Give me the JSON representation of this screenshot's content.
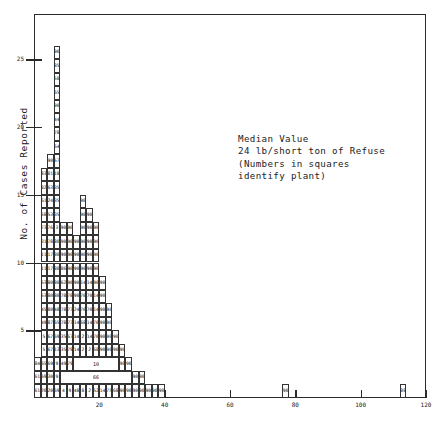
{
  "chart_data": {
    "type": "bar",
    "title": "",
    "xlabel": "",
    "ylabel": "No. of Cases Reported",
    "xlim": [
      0,
      120
    ],
    "ylim": [
      0,
      28
    ],
    "grid": false,
    "legend": null,
    "annotation": "Median Value\n24 lb/short ton of Refuse\n(Numbers in squares\nidentify plant)",
    "xticks": [
      20,
      40,
      60,
      80,
      100,
      120
    ],
    "yticks": [
      5,
      10,
      15,
      20,
      25
    ],
    "note": "Each unit square is one case; numbers inside squares identify the plant.",
    "categories": [
      0,
      2,
      4,
      6,
      8,
      10,
      12,
      14,
      16,
      18,
      20,
      22,
      24,
      26,
      28,
      30,
      32,
      34,
      36,
      38,
      40,
      42,
      44,
      46,
      48,
      50,
      76,
      112
    ],
    "values": [
      3,
      17,
      18,
      26,
      13,
      13,
      12,
      15,
      14,
      13,
      9,
      7,
      5,
      4,
      3,
      2,
      2,
      1,
      1,
      1,
      0,
      0,
      0,
      0,
      0,
      0,
      1,
      1
    ],
    "columns": [
      {
        "x_left": 0,
        "x_right": 2,
        "count": 3,
        "labels": [
          "84",
          "61",
          "61"
        ]
      },
      {
        "x_left": 2,
        "x_right": 4,
        "count": 17,
        "labels": [
          "83",
          "82",
          "61",
          "58",
          "73",
          "31",
          "11",
          "11",
          "53",
          "53",
          "45",
          "49",
          "5",
          "5",
          "65",
          "69",
          "20"
        ]
      },
      {
        "x_left": 4,
        "x_right": 6,
        "count": 18,
        "labels": [
          "90",
          "81",
          "63",
          "24",
          "53",
          "76",
          "78",
          "17",
          "17",
          "80",
          "80",
          "80",
          "87",
          "67",
          "67",
          "69",
          "30",
          "20"
        ]
      },
      {
        "x_left": 6,
        "x_right": 8,
        "count": 26,
        "labels": [
          "90",
          "85",
          "58",
          "65",
          "90",
          "44",
          "78",
          "64",
          "57",
          "18",
          "35",
          "35",
          "35",
          "3",
          "80",
          "80",
          "80",
          "80",
          "80",
          "48",
          "65",
          "69",
          "13",
          "9",
          "9",
          "69"
        ]
      },
      {
        "x_left": 8,
        "x_right": 10,
        "count": 13,
        "labels": [
          "90",
          "90",
          "90",
          "86",
          "62",
          "78",
          "78",
          "78",
          "35",
          "35",
          "49",
          "4",
          "4"
        ]
      },
      {
        "x_left": 10,
        "x_right": 12,
        "count": 13,
        "labels": [
          "90",
          "90",
          "90",
          "90",
          "90",
          "78",
          "77",
          "77",
          "67",
          "79",
          "79",
          "8",
          "9"
        ]
      },
      {
        "x_left": 12,
        "x_right": 14,
        "count": 12,
        "labels": [
          "90",
          "90",
          "90",
          "90",
          "90",
          "24",
          "14",
          "14",
          "14",
          "78",
          "77",
          "48"
        ]
      },
      {
        "x_left": 14,
        "x_right": 16,
        "count": 15,
        "labels": [
          "90",
          "90",
          "90",
          "90",
          "90",
          "90",
          "14",
          "70",
          "70",
          "68",
          "2",
          "2",
          "51",
          "8",
          "8"
        ]
      },
      {
        "x_left": 16,
        "x_right": 18,
        "count": 14,
        "labels": [
          "90",
          "90",
          "90",
          "90",
          "90",
          "14",
          "70",
          "70",
          "14",
          "14",
          "2",
          "70",
          "2",
          "2"
        ]
      },
      {
        "x_left": 18,
        "x_right": 20,
        "count": 13,
        "labels": [
          "90",
          "90",
          "90",
          "90",
          "90",
          "14",
          "14",
          "70",
          "70",
          "68",
          "2",
          "37",
          "52"
        ]
      },
      {
        "x_left": 20,
        "x_right": 22,
        "count": 9,
        "labels": [
          "90",
          "90",
          "90",
          "90",
          "90",
          "90",
          "50",
          "68",
          "14"
        ]
      },
      {
        "x_left": 22,
        "x_right": 24,
        "count": 7,
        "labels": [
          "90",
          "90",
          "90",
          "90",
          "79",
          "70",
          "75"
        ]
      },
      {
        "x_left": 24,
        "x_right": 26,
        "count": 5,
        "labels": [
          "90",
          "90",
          "90",
          "90",
          "68"
        ]
      },
      {
        "x_left": 26,
        "x_right": 28,
        "count": 4,
        "labels": [
          "90",
          "90",
          "90",
          "90"
        ]
      },
      {
        "x_left": 28,
        "x_right": 30,
        "count": 3,
        "labels": [
          "90",
          "90",
          "90"
        ]
      },
      {
        "x_left": 30,
        "x_right": 32,
        "count": 2,
        "labels": [
          "90",
          "90"
        ]
      },
      {
        "x_left": 32,
        "x_right": 34,
        "count": 2,
        "labels": [
          "90",
          "90"
        ]
      },
      {
        "x_left": 34,
        "x_right": 36,
        "count": 1,
        "labels": [
          "90"
        ]
      },
      {
        "x_left": 36,
        "x_right": 38,
        "count": 1,
        "labels": [
          "90"
        ]
      },
      {
        "x_left": 38,
        "x_right": 40,
        "count": 1,
        "labels": [
          "90"
        ]
      },
      {
        "x_left": 76,
        "x_right": 78,
        "count": 1,
        "labels": [
          "90"
        ]
      },
      {
        "x_left": 112,
        "x_right": 114,
        "count": 1,
        "labels": [
          "88"
        ]
      }
    ],
    "merged_cells": [
      {
        "row": 2,
        "x_left": 12,
        "x_right": 26,
        "label": "10"
      },
      {
        "row": 1,
        "x_left": 8,
        "x_right": 30,
        "label": "66"
      }
    ]
  }
}
